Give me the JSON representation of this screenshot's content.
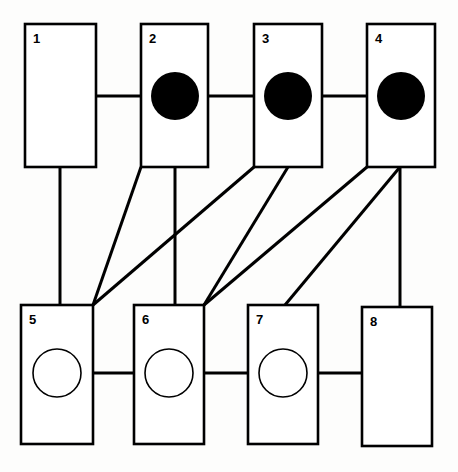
{
  "diagram": {
    "canvas": {
      "width": 458,
      "height": 472,
      "background": "#fdfdfc"
    },
    "style": {
      "box_stroke": "#000000",
      "box_fill": "#ffffff",
      "box_stroke_width": 2.6,
      "edge_color": "#000000",
      "edge_width": 3.0,
      "filled_marker_color": "#000000",
      "open_marker_fill": "#ffffff",
      "label_color": "#000000",
      "label_font_size": 13
    },
    "rows": [
      {
        "name": "top-row",
        "label": "top row",
        "node_ids": [
          1,
          2,
          3,
          4
        ]
      },
      {
        "name": "bottom-row",
        "label": "bottom row",
        "node_ids": [
          5,
          6,
          7,
          8
        ]
      }
    ],
    "nodes": [
      {
        "id": "node-1",
        "label": "1",
        "x": 25,
        "y": 24,
        "w": 71,
        "h": 143,
        "row": "top",
        "marker": "none",
        "marker_cx": 0,
        "marker_cy": 0,
        "marker_r": 0
      },
      {
        "id": "node-2",
        "label": "2",
        "x": 141,
        "y": 24,
        "w": 67,
        "h": 143,
        "row": "top",
        "marker": "filled",
        "marker_cx": 175,
        "marker_cy": 96,
        "marker_r": 24
      },
      {
        "id": "node-3",
        "label": "3",
        "x": 254,
        "y": 24,
        "w": 68,
        "h": 143,
        "row": "top",
        "marker": "filled",
        "marker_cx": 288,
        "marker_cy": 96,
        "marker_r": 24
      },
      {
        "id": "node-4",
        "label": "4",
        "x": 367,
        "y": 24,
        "w": 68,
        "h": 143,
        "row": "top",
        "marker": "filled",
        "marker_cx": 401,
        "marker_cy": 96,
        "marker_r": 24
      },
      {
        "id": "node-5",
        "label": "5",
        "x": 21,
        "y": 305,
        "w": 72,
        "h": 139,
        "row": "bottom",
        "marker": "open",
        "marker_cx": 57,
        "marker_cy": 373,
        "marker_r": 24
      },
      {
        "id": "node-6",
        "label": "6",
        "x": 134,
        "y": 305,
        "w": 70,
        "h": 139,
        "row": "bottom",
        "marker": "open",
        "marker_cx": 169,
        "marker_cy": 373,
        "marker_r": 24
      },
      {
        "id": "node-7",
        "label": "7",
        "x": 248,
        "y": 305,
        "w": 70,
        "h": 139,
        "row": "bottom",
        "marker": "open",
        "marker_cx": 283,
        "marker_cy": 373,
        "marker_r": 24
      },
      {
        "id": "node-8",
        "label": "8",
        "x": 362,
        "y": 307,
        "w": 70,
        "h": 139,
        "row": "bottom",
        "marker": "none",
        "marker_cx": 0,
        "marker_cy": 0,
        "marker_r": 0
      }
    ],
    "edges": [
      {
        "id": "edge-1-2",
        "from": "1",
        "to": "2",
        "kind": "horizontal",
        "x1": 96,
        "y1": 96,
        "x2": 141,
        "y2": 96
      },
      {
        "id": "edge-2-3",
        "from": "2",
        "to": "3",
        "kind": "horizontal",
        "x1": 208,
        "y1": 96,
        "x2": 254,
        "y2": 96
      },
      {
        "id": "edge-3-4",
        "from": "3",
        "to": "4",
        "kind": "horizontal",
        "x1": 322,
        "y1": 96,
        "x2": 367,
        "y2": 96
      },
      {
        "id": "edge-5-6",
        "from": "5",
        "to": "6",
        "kind": "horizontal",
        "x1": 93,
        "y1": 373,
        "x2": 134,
        "y2": 373
      },
      {
        "id": "edge-6-7",
        "from": "6",
        "to": "7",
        "kind": "horizontal",
        "x1": 204,
        "y1": 373,
        "x2": 248,
        "y2": 373
      },
      {
        "id": "edge-7-8",
        "from": "7",
        "to": "8",
        "kind": "horizontal",
        "x1": 318,
        "y1": 373,
        "x2": 362,
        "y2": 373
      },
      {
        "id": "edge-1-5",
        "from": "1",
        "to": "5",
        "kind": "vertical",
        "x1": 60,
        "y1": 167,
        "x2": 60,
        "y2": 305
      },
      {
        "id": "edge-2-6",
        "from": "2",
        "to": "6",
        "kind": "vertical",
        "x1": 175,
        "y1": 167,
        "x2": 175,
        "y2": 305
      },
      {
        "id": "edge-4-8",
        "from": "4",
        "to": "8",
        "kind": "vertical",
        "x1": 400,
        "y1": 167,
        "x2": 400,
        "y2": 307
      },
      {
        "id": "edge-2-5",
        "from": "2",
        "to": "5",
        "kind": "diagonal",
        "x1": 141,
        "y1": 167,
        "x2": 93,
        "y2": 305
      },
      {
        "id": "edge-3-5",
        "from": "3",
        "to": "5",
        "kind": "diagonal",
        "x1": 254,
        "y1": 167,
        "x2": 93,
        "y2": 305
      },
      {
        "id": "edge-3-6",
        "from": "3",
        "to": "6",
        "kind": "diagonal",
        "x1": 288,
        "y1": 167,
        "x2": 204,
        "y2": 305
      },
      {
        "id": "edge-4-6",
        "from": "4",
        "to": "6",
        "kind": "diagonal",
        "x1": 367,
        "y1": 167,
        "x2": 204,
        "y2": 305
      },
      {
        "id": "edge-4-7",
        "from": "4",
        "to": "7",
        "kind": "diagonal",
        "x1": 400,
        "y1": 167,
        "x2": 285,
        "y2": 305
      }
    ]
  }
}
